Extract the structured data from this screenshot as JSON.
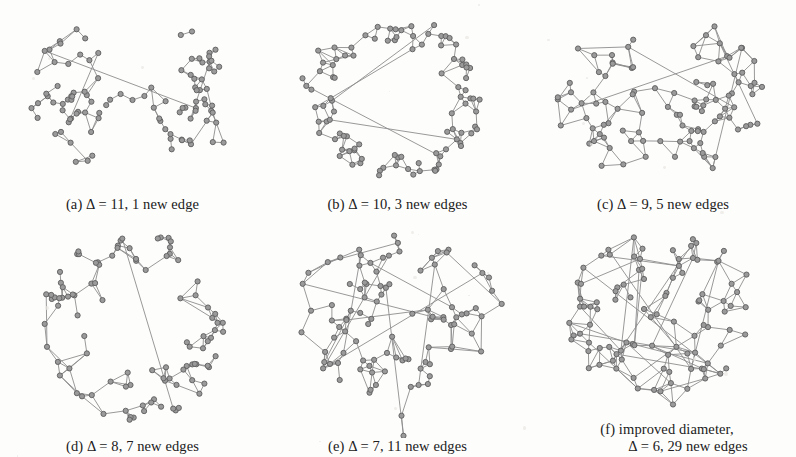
{
  "figure": {
    "background_color": "#fdfdfc",
    "ink_color": "#8d8d8d",
    "node_fill": "#9a9a9a",
    "node_stroke": "#5e5e5e",
    "panel_count": 6
  },
  "panels": [
    {
      "id": "a",
      "caption_prefix": "(a)",
      "symbol": "Δ",
      "caption": "(a) Δ = 11, 1 new edge",
      "delta": 11,
      "new_edges": 1,
      "new_edges_label": "1 new edge",
      "layout": "two-clusters-single-bridge",
      "seed": 11,
      "clusters": 2,
      "node_count": 100
    },
    {
      "id": "b",
      "caption_prefix": "(b)",
      "symbol": "Δ",
      "caption": "(b) Δ = 10, 3 new edges",
      "delta": 10,
      "new_edges": 3,
      "new_edges_label": "3 new edges",
      "layout": "horseshoe-ring",
      "seed": 23,
      "clusters": 2,
      "node_count": 100
    },
    {
      "id": "c",
      "caption_prefix": "(c)",
      "symbol": "Δ",
      "caption": "(c) Δ = 9, 5 new edges",
      "delta": 9,
      "new_edges": 5,
      "new_edges_label": "5 new edges",
      "layout": "two-lobes-wide",
      "seed": 37,
      "clusters": 2,
      "node_count": 100
    },
    {
      "id": "d",
      "caption_prefix": "(d)",
      "symbol": "Δ",
      "caption": "(d) Δ = 8, 7 new edges",
      "delta": 8,
      "new_edges": 7,
      "new_edges_label": "7 new edges",
      "layout": "ring-with-hole",
      "seed": 51,
      "clusters": 1,
      "node_count": 100
    },
    {
      "id": "e",
      "caption_prefix": "(e)",
      "symbol": "Δ",
      "caption": "(e) Δ = 7, 11 new edges",
      "delta": 7,
      "new_edges": 11,
      "new_edges_label": "11 new edges",
      "layout": "broad-blob-with-tail",
      "seed": 67,
      "clusters": 1,
      "node_count": 100
    },
    {
      "id": "f",
      "caption_prefix": "(f)",
      "symbol": "Δ",
      "caption_line1": "(f) improved diameter,",
      "caption_line2": "Δ = 6, 29 new edges",
      "caption": "(f) improved diameter, Δ = 6, 29 new edges",
      "delta": 6,
      "new_edges": 29,
      "new_edges_label": "29 new edges",
      "layout": "dense-blob",
      "seed": 83,
      "clusters": 1,
      "node_count": 100
    }
  ]
}
